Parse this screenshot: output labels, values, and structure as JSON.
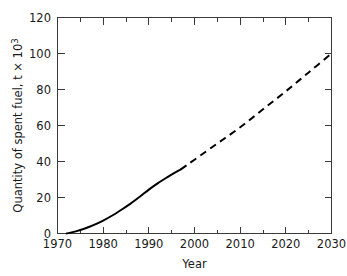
{
  "chart_data": {
    "type": "line",
    "title": "",
    "xlabel": "Year",
    "ylabel": "Quantity of spent fuel, t × 10",
    "ylabel_exponent": "3",
    "xlim": [
      1970,
      2030
    ],
    "ylim": [
      0,
      120
    ],
    "x_major_ticks": [
      1970,
      1980,
      1990,
      2000,
      2010,
      2020,
      2030
    ],
    "x_major_tick_labels": [
      "1970",
      "1980",
      "1990",
      "2000",
      "2010",
      "2020",
      "2030"
    ],
    "x_minor_ticks": [
      1975,
      1985,
      1995,
      2005,
      2015,
      2025
    ],
    "y_major_ticks": [
      0,
      20,
      40,
      60,
      80,
      100,
      120
    ],
    "y_major_tick_labels": [
      "0",
      "20",
      "40",
      "60",
      "80",
      "100",
      "120"
    ],
    "grid": false,
    "legend": false,
    "series": [
      {
        "name": "Cumulative spent fuel (historical)",
        "style": "solid",
        "color": "#000000",
        "x": [
          1972,
          1974,
          1976,
          1978,
          1980,
          1982,
          1984,
          1986,
          1988,
          1990,
          1992,
          1994,
          1996,
          1997
        ],
        "y": [
          0,
          1.2,
          2.8,
          4.8,
          7.2,
          10.0,
          13.2,
          16.6,
          20.4,
          24.4,
          28.0,
          31.2,
          34.2,
          35.6
        ]
      },
      {
        "name": "Cumulative spent fuel (projected)",
        "style": "dashed",
        "color": "#000000",
        "x": [
          1997,
          2000,
          2005,
          2010,
          2015,
          2020,
          2025,
          2030
        ],
        "y": [
          35.6,
          41.0,
          50.0,
          59.0,
          69.0,
          79.0,
          89.5,
          100.0
        ]
      }
    ],
    "annotations": []
  }
}
